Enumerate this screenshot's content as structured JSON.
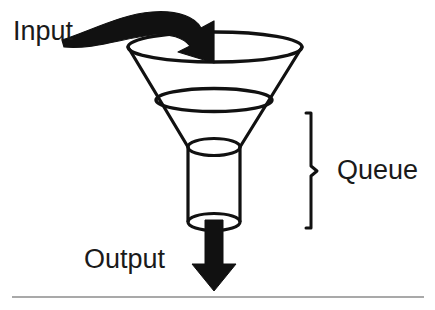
{
  "diagram": {
    "background_color": "#ffffff",
    "stroke_color": "#111111",
    "fill_color": "#111111",
    "baseline_rule_color": "#8c8c8c",
    "labels": {
      "input": "Input",
      "output": "Output",
      "queue": "Queue"
    },
    "shapes": {
      "funnel_top_ellipse": "funnel-top-rim",
      "funnel_mid_ellipse": "funnel-mid-rim",
      "funnel_cone": "funnel-cone-body",
      "neck_cylinder": "queue-neck-cylinder",
      "input_arrow": "input-curved-arrow",
      "output_arrow": "output-down-arrow",
      "queue_brace": "queue-brace",
      "baseline_rule": "bottom-divider"
    }
  }
}
